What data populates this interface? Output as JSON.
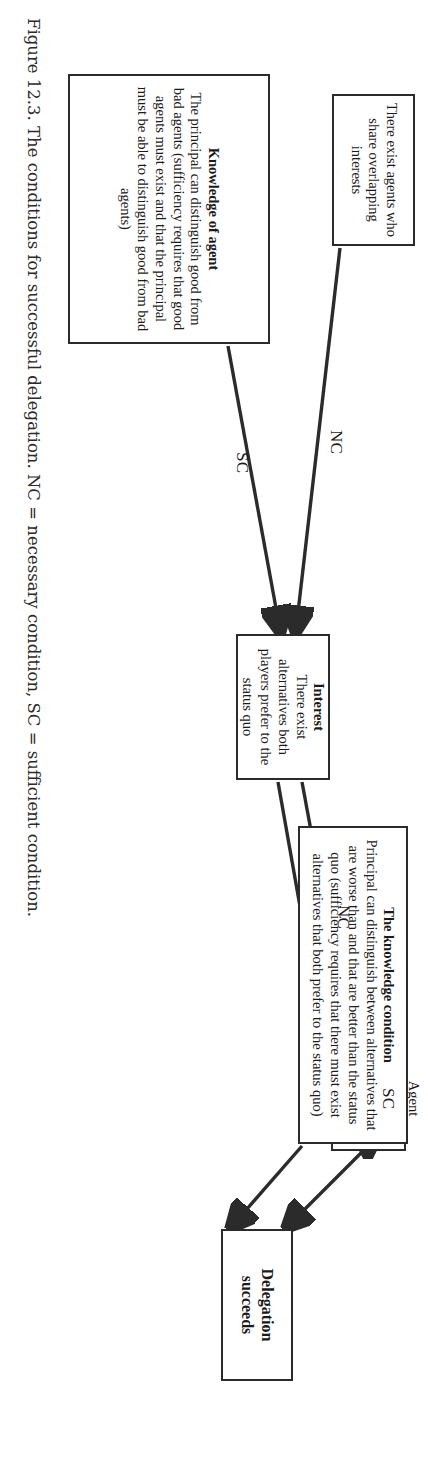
{
  "figure": {
    "caption": "Figure 12.3. The conditions for successful delegation. NC = necessary condition, SC = sufficient condition.",
    "nodes": {
      "delegation_succeeds": {
        "title": "Delegation",
        "title2": "succeeds"
      },
      "agent_proposes": {
        "body": "Agent proposes an alternative that the principal prefers to the status quo"
      },
      "knowledge_condition": {
        "title": "The knowledge condition",
        "body": "Principal can distinguish between alternatives that are worse than and that are better than the status quo (sufficiency requires that there must exist alternatives that both prefer to the status quo)"
      },
      "interest": {
        "title": "Interest",
        "body": "There exist alternatives both players prefer to the status quo"
      },
      "overlapping_interests": {
        "body": "There exist agents who share overlapping interests"
      },
      "knowledge_of_agent": {
        "title": "Knowledge of agent",
        "body": "The principal can distinguish good from bad agents (sufficiency requires that good agents must exist and that the principal must be able to distinguish good from bad agents)"
      }
    },
    "edge_labels": {
      "sc_knowledge_to_agent": "SC",
      "nc_interest_to_agent": "NC",
      "nc_overlapping_to_interest": "NC",
      "sc_knowledgeagent_to_interest": "SC"
    },
    "colors": {
      "stroke": "#2b2b2b",
      "text": "#1a1a1a",
      "background": "#ffffff"
    }
  }
}
